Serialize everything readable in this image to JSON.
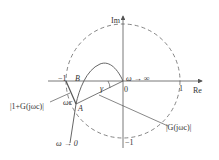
{
  "diagram": {
    "type": "nyquist-plot",
    "axes": {
      "re_label": "Re",
      "im_label": "Im",
      "origin_label": "0",
      "tick_pos_re": "1",
      "tick_neg_re": "−1",
      "tick_neg_im": "−1"
    },
    "circle": {
      "style": "dashed",
      "radius": 1
    },
    "points": {
      "B": "B",
      "A": "A",
      "omega_c": "ωc"
    },
    "annotations": {
      "omega_inf": "ω → ∞",
      "omega_zero": "ω → 0",
      "gamma": "γ",
      "one_plus_G": "|1+G(jωc)|",
      "G_mag": "|G(jωc)|"
    },
    "colors": {
      "line": "#555555",
      "text": "#333333"
    }
  }
}
